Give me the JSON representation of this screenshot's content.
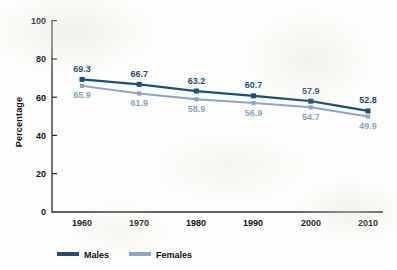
{
  "chart_data": {
    "type": "line",
    "title": "",
    "xlabel": "",
    "ylabel": "Percentage",
    "x": [
      1960,
      1970,
      1980,
      1990,
      2000,
      2010
    ],
    "categories": [
      "1960",
      "1970",
      "1980",
      "1990",
      "2000",
      "2010"
    ],
    "series": [
      {
        "name": "Males",
        "color": "#1F4E79",
        "values": [
          69.3,
          66.7,
          63.2,
          60.7,
          57.9,
          52.8
        ],
        "labels": [
          "69.3",
          "66.7",
          "63.2",
          "60.7",
          "57.9",
          "52.8"
        ]
      },
      {
        "name": "Females",
        "color": "#8BA6C9",
        "values": [
          65.9,
          61.9,
          58.9,
          56.9,
          54.7,
          49.9
        ],
        "labels": [
          "65.9",
          "61.9",
          "58.9",
          "56.9",
          "54.7",
          "49.9"
        ]
      }
    ],
    "ylim": [
      0,
      100
    ],
    "yticks": [
      0,
      20,
      40,
      60,
      80,
      100
    ],
    "ytick_labels": [
      "0",
      "20",
      "40",
      "60",
      "80",
      "100"
    ],
    "xtick_labels": [
      "1960",
      "1970",
      "1980",
      "1990",
      "2000",
      "2010"
    ],
    "grid": false,
    "legend_position": "bottom-left",
    "marker": "square"
  },
  "legend": {
    "entries": [
      {
        "label": "Males",
        "color": "#1F4E79"
      },
      {
        "label": "Females",
        "color": "#8BA6C9"
      }
    ]
  },
  "axes": {
    "y_title": "Percentage"
  }
}
